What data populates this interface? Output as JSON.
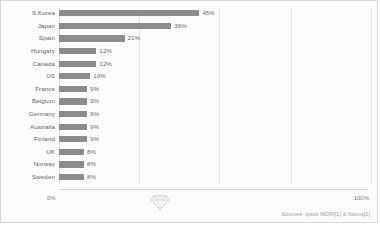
{
  "chart_data": {
    "type": "bar",
    "orientation": "horizontal",
    "title": "",
    "xlabel": "",
    "ylabel": "",
    "xlim": [
      0,
      100
    ],
    "grid": true,
    "legend": null,
    "categories": [
      "S.Korea",
      "Japan",
      "Spain",
      "Hungary",
      "Canada",
      "US",
      "France",
      "Belgium",
      "Germany",
      "Australia",
      "Finland",
      "UK",
      "Norway",
      "Sweden"
    ],
    "values": [
      45,
      36,
      21,
      12,
      12,
      10,
      9,
      9,
      9,
      9,
      9,
      8,
      8,
      8
    ],
    "value_labels": [
      "45%",
      "36%",
      "21%",
      "12%",
      "12%",
      "10%",
      "9%",
      "9%",
      "9%",
      "9%",
      "9%",
      "8%",
      "8%",
      "8%"
    ],
    "bar_color": "#8c8c8c",
    "axis_ticks": [
      "0%",
      "100%"
    ],
    "gridline_positions": [
      25,
      50,
      75,
      100
    ]
  },
  "axis": {
    "min_label": "0%",
    "max_label": "100%"
  },
  "footer": {
    "source": "Sources: Ipsos MORI[1] & Novus[1]"
  },
  "watermark": {
    "icon": "diamond-icon"
  }
}
